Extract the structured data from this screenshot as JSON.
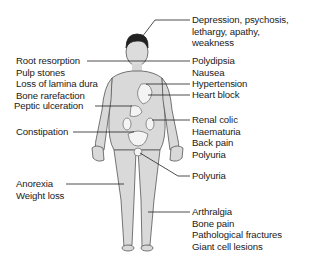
{
  "diagram": {
    "left_labels": [
      {
        "id": "dental",
        "lines": [
          "Root resorption",
          "Pulp stones",
          "Loss of lamina dura",
          "Bone rarefaction"
        ]
      },
      {
        "id": "gi",
        "lines": [
          "Peptic ulceration"
        ]
      },
      {
        "id": "bowel",
        "lines": [
          "Constipation"
        ]
      },
      {
        "id": "systemic",
        "lines": [
          "Anorexia",
          "Weight loss"
        ]
      }
    ],
    "right_labels": [
      {
        "id": "neuro",
        "lines": [
          "Depression, psychosis,",
          "lethargy, apathy,",
          "weakness"
        ]
      },
      {
        "id": "thirst",
        "lines": [
          "Polydipsia",
          "Nausea"
        ]
      },
      {
        "id": "cardiac1",
        "lines": [
          "Hypertension"
        ]
      },
      {
        "id": "cardiac2",
        "lines": [
          "Heart block"
        ]
      },
      {
        "id": "renal",
        "lines": [
          "Renal colic",
          "Haematuria",
          "Back pain",
          "Polyuria"
        ]
      },
      {
        "id": "bladder",
        "lines": [
          "Polyuria"
        ]
      },
      {
        "id": "skeletal",
        "lines": [
          "Arthralgia",
          "Bone pain",
          "Pathological fractures",
          "Giant cell lesions"
        ]
      }
    ]
  }
}
